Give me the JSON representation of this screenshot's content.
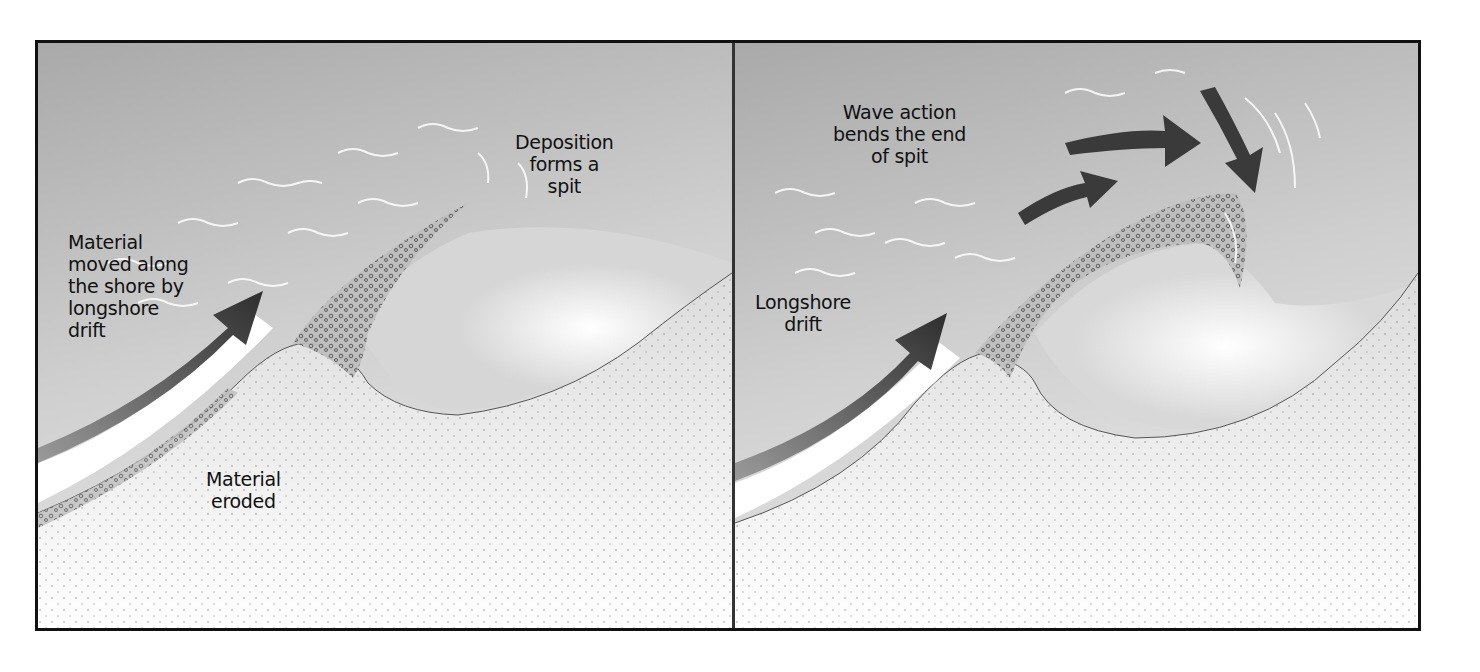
{
  "figure": {
    "panels": [
      {
        "id": "left",
        "stage": "Spit formation",
        "labels": {
          "drift": "Material\nmoved along\nthe shore by\nlongshore\ndrift",
          "deposition": "Deposition\nforms a\nspit",
          "eroded": "Material\neroded"
        },
        "arrows": [
          "longshore-drift-arrow"
        ]
      },
      {
        "id": "right",
        "stage": "Recurved spit",
        "labels": {
          "wave_action": "Wave action\nbends the end\nof spit",
          "drift": "Longshore\ndrift"
        },
        "arrows": [
          "longshore-drift-arrow",
          "wave-arrow-lower",
          "wave-arrow-upper",
          "wave-arrow-down"
        ]
      }
    ],
    "colors": {
      "sea": "#b8b8b8",
      "land": "#e8e8e8",
      "arrow": "#3a3a3a",
      "border": "#111111",
      "text": "#111111"
    }
  }
}
